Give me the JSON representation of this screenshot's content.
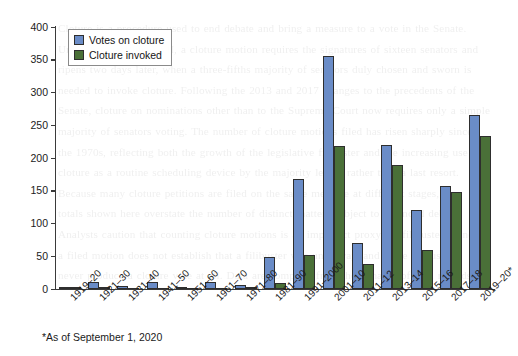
{
  "chart_data": {
    "type": "bar",
    "title": "",
    "xlabel": "",
    "ylabel": "",
    "ylim": [
      0,
      400
    ],
    "yticks": [
      0,
      50,
      100,
      150,
      200,
      250,
      300,
      350,
      400
    ],
    "grid": false,
    "legend_position": "top-left",
    "categories": [
      "1919–20",
      "1921–30",
      "1931–40",
      "1941–50",
      "1951–60",
      "1961–70",
      "1971–80",
      "1981–90",
      "1991–2000",
      "2001–10",
      "2011–12",
      "2013–14",
      "2015–16",
      "2017–18",
      "2019–20*"
    ],
    "series": [
      {
        "name": "Votes on cloture",
        "color": "#6a8cc7",
        "values": [
          2,
          10,
          4,
          10,
          3,
          10,
          6,
          48,
          169,
          357,
          70,
          220,
          121,
          158,
          267
        ]
      },
      {
        "name": "Cloture invoked",
        "color": "#4a7038",
        "values": [
          1,
          3,
          0,
          0,
          0,
          0,
          1,
          8,
          52,
          219,
          38,
          189,
          59,
          148,
          235
        ]
      }
    ],
    "footnote": "*As of September 1, 2020"
  },
  "legend": {
    "items": [
      {
        "label": "Votes on cloture"
      },
      {
        "label": "Cloture invoked"
      }
    ]
  },
  "ghost_text": {
    "lines": [
      "Cloture is a procedure used to end debate and bring a measure to a vote in the Senate.",
      "Under Senate Rule XXII, a cloture motion requires the signatures of sixteen senators and",
      "ripens two days later, when a three-fifths majority of senators duly chosen and sworn is",
      "needed to invoke cloture. Following the 2013 and 2017 changes to the precedents of the",
      "Senate, cloture on nominations other than to the Supreme Court now requires only a simple",
      "majority of senators voting. The number of cloture motions filed has risen sharply since",
      "the 1970s, reflecting both the growth of the legislative filibuster and the increasing use of",
      "cloture as a routine scheduling device by the majority leader rather than a last resort.",
      "Because many cloture petitions are filed on the same measure at different stages, the",
      "totals shown here overstate the number of distinct matters subject to extended debate.",
      "",
      "Analysts caution that counting cloture motions is an imperfect proxy for filibusters, since",
      "a filed motion does not establish that a filibuster was underway, and some filibusters",
      "never produce a cloture vote at all. Data are compiled from the Senate's official records."
    ]
  }
}
